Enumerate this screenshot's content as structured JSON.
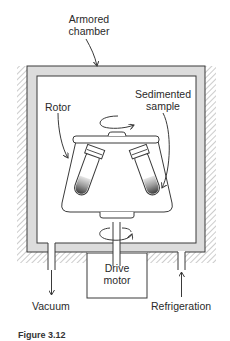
{
  "labels": {
    "armored_chamber_line1": "Armored",
    "armored_chamber_line2": "chamber",
    "rotor": "Rotor",
    "sedimented_sample_line1": "Sedimented",
    "sedimented_sample_line2": "sample",
    "drive_motor_line1": "Drive",
    "drive_motor_line2": "motor",
    "vacuum": "Vacuum",
    "refrigeration": "Refrigeration",
    "figure_caption": "Figure 3.12"
  },
  "colors": {
    "line": "#3a3a3a",
    "chamber_fill": "#dcdcdc",
    "hatch": "#9a9a9a",
    "sample_dark": "#555555",
    "sample_light": "#c8c8c8"
  }
}
